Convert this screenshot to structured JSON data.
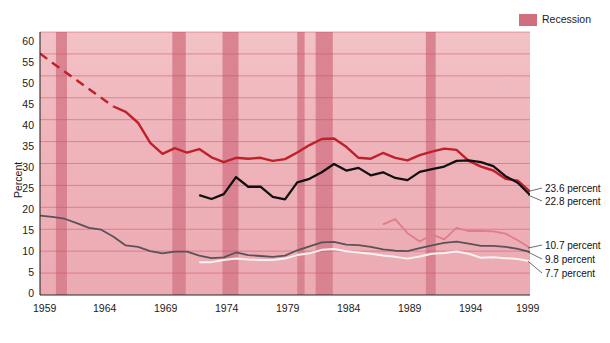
{
  "legend": {
    "items": [
      {
        "label": "Recession",
        "color": "#d06e7e",
        "type": "band"
      }
    ]
  },
  "axes": {
    "ylabel": "Percent",
    "yticks": [
      "0",
      "5",
      "10",
      "15",
      "20",
      "25",
      "30",
      "35",
      "40",
      "45",
      "50",
      "55",
      "60"
    ],
    "xticks": [
      "1959",
      "1964",
      "1969",
      "1974",
      "1979",
      "1984",
      "1989",
      "1994",
      "1999"
    ]
  },
  "series_labels": {
    "black": "Black",
    "hispanic": "Hispanic",
    "white": "White",
    "white_non_hispanic": "White non-Hispanic",
    "asian": "Asian and Pacific Islanders"
  },
  "end_labels": [
    {
      "name": "black-end-label",
      "text": "23.6 percent"
    },
    {
      "name": "hispanic-end-label",
      "text": "22.8 percent"
    },
    {
      "name": "asian-end-label",
      "text": "10.7 percent"
    },
    {
      "name": "white-end-label",
      "text": "9.8 percent"
    },
    {
      "name": "white-non-hispanic-end-label",
      "text": "7.7 percent"
    }
  ],
  "colors": {
    "black_series": "#c0202a",
    "hispanic_series": "#111111",
    "white_series": "#5a5258",
    "white_non_hispanic_series": "#f7f2f2",
    "asian_series": "#e07c8c",
    "recession_band": "#d87f8e",
    "plot_bg_top": "#f0b9be",
    "plot_bg_bottom": "#edacb4",
    "gridline": "#c8515f"
  },
  "chart_data": {
    "type": "line",
    "title": "",
    "xlabel": "",
    "ylabel": "Percent",
    "xlim": [
      1959,
      1999
    ],
    "ylim": [
      0,
      60
    ],
    "grid": true,
    "legend_position": "top-right",
    "recessions": [
      {
        "start": 1960.3,
        "end": 1961.2
      },
      {
        "start": 1969.8,
        "end": 1970.9
      },
      {
        "start": 1973.9,
        "end": 1975.2
      },
      {
        "start": 1980.0,
        "end": 1980.6
      },
      {
        "start": 1981.5,
        "end": 1982.9
      },
      {
        "start": 1990.5,
        "end": 1991.3
      }
    ],
    "x": [
      1959,
      1960,
      1961,
      1962,
      1963,
      1964,
      1965,
      1966,
      1967,
      1968,
      1969,
      1970,
      1971,
      1972,
      1973,
      1974,
      1975,
      1976,
      1977,
      1978,
      1979,
      1980,
      1981,
      1982,
      1983,
      1984,
      1985,
      1986,
      1987,
      1988,
      1989,
      1990,
      1991,
      1992,
      1993,
      1994,
      1995,
      1996,
      1997,
      1998,
      1999
    ],
    "series": [
      {
        "name": "Black",
        "color": "#c0202a",
        "dashed_through": 1965,
        "values": [
          55.1,
          53.0,
          51.0,
          49.0,
          47.0,
          45.0,
          43.0,
          41.8,
          39.3,
          34.7,
          32.2,
          33.5,
          32.5,
          33.3,
          31.4,
          30.3,
          31.3,
          31.1,
          31.3,
          30.6,
          31.0,
          32.5,
          34.2,
          35.6,
          35.7,
          33.8,
          31.3,
          31.1,
          32.4,
          31.3,
          30.7,
          31.9,
          32.7,
          33.4,
          33.1,
          30.6,
          29.3,
          28.4,
          26.5,
          26.1,
          23.6
        ]
      },
      {
        "name": "Hispanic",
        "color": "#111111",
        "start_year": 1972,
        "values": [
          null,
          null,
          null,
          null,
          null,
          null,
          null,
          null,
          null,
          null,
          null,
          null,
          null,
          22.8,
          21.9,
          23.0,
          26.9,
          24.7,
          24.7,
          22.4,
          21.8,
          25.7,
          26.5,
          28.0,
          29.9,
          28.4,
          29.0,
          27.3,
          28.0,
          26.7,
          26.2,
          28.1,
          28.7,
          29.3,
          30.6,
          30.7,
          30.3,
          29.4,
          27.1,
          25.6,
          22.8
        ]
      },
      {
        "name": "White",
        "color": "#5a5258",
        "values": [
          18.1,
          17.8,
          17.4,
          16.4,
          15.3,
          14.9,
          13.3,
          11.3,
          11.0,
          10.0,
          9.5,
          9.9,
          9.9,
          9.0,
          8.4,
          8.6,
          9.7,
          9.1,
          8.9,
          8.7,
          9.0,
          10.2,
          11.1,
          12.0,
          12.1,
          11.5,
          11.4,
          11.0,
          10.4,
          10.1,
          10.0,
          10.7,
          11.3,
          11.9,
          12.2,
          11.7,
          11.2,
          11.2,
          11.0,
          10.5,
          9.8
        ]
      },
      {
        "name": "White non-Hispanic",
        "color": "#f7f2f2",
        "start_year": 1972,
        "values": [
          null,
          null,
          null,
          null,
          null,
          null,
          null,
          null,
          null,
          null,
          null,
          null,
          null,
          7.5,
          7.5,
          8.0,
          8.3,
          8.1,
          8.0,
          8.0,
          8.3,
          9.1,
          9.5,
          10.3,
          10.5,
          10.0,
          9.7,
          9.4,
          9.0,
          8.7,
          8.3,
          8.8,
          9.4,
          9.6,
          9.9,
          9.4,
          8.5,
          8.6,
          8.4,
          8.2,
          7.7
        ]
      },
      {
        "name": "Asian and Pacific Islanders",
        "color": "#e07c8c",
        "start_year": 1987,
        "values": [
          null,
          null,
          null,
          null,
          null,
          null,
          null,
          null,
          null,
          null,
          null,
          null,
          null,
          null,
          null,
          null,
          null,
          null,
          null,
          null,
          null,
          null,
          null,
          null,
          null,
          null,
          null,
          null,
          16.1,
          17.3,
          14.1,
          12.2,
          13.8,
          12.7,
          15.3,
          14.6,
          14.6,
          14.5,
          14.0,
          12.5,
          10.7
        ]
      }
    ]
  }
}
